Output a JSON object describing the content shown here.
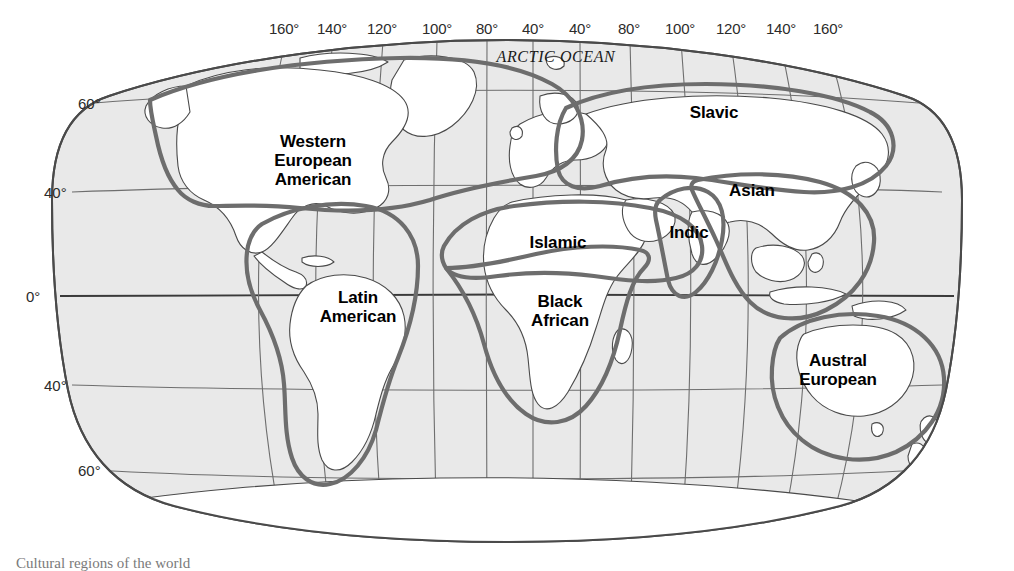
{
  "figure": {
    "title_caption": "Cultural regions of the world",
    "ocean_label": "ARCTIC OCEAN",
    "projection": "Robinson"
  },
  "colors": {
    "ocean_fill": "#e8e8e8",
    "land_fill": "#ffffff",
    "graticule": "#6e6e6e",
    "coastline": "#4a4a4a",
    "region_boundary": "#6e6e6e",
    "text": "#1a1a1a",
    "page_background": "#ffffff"
  },
  "axes": {
    "longitude_label_suffix": "°",
    "longitude_ticks": [
      {
        "label": "160°",
        "x": 284
      },
      {
        "label": "140°",
        "x": 332
      },
      {
        "label": "120°",
        "x": 382
      },
      {
        "label": "100°",
        "x": 437
      },
      {
        "label": "80°",
        "x": 487
      },
      {
        "label": "40°",
        "x": 533
      },
      {
        "label": "40°",
        "x": 580
      },
      {
        "label": "80°",
        "x": 629
      },
      {
        "label": "100°",
        "x": 680
      },
      {
        "label": "120°",
        "x": 731
      },
      {
        "label": "140°",
        "x": 781
      },
      {
        "label": "160°",
        "x": 828
      }
    ],
    "latitude_ticks": [
      {
        "label": "60°",
        "y": 103
      },
      {
        "label": "40°",
        "y": 192
      },
      {
        "label": "0°",
        "y": 296
      },
      {
        "label": "40°",
        "y": 385
      },
      {
        "label": "60°",
        "y": 470
      }
    ],
    "latitude_tick_x": [
      113,
      98,
      83,
      98,
      113
    ]
  },
  "regions": [
    {
      "id": "western-european-american",
      "label": "Western\nEuropean\nAmerican",
      "x": 313,
      "y": 160
    },
    {
      "id": "latin-american",
      "label": "Latin\nAmerican",
      "x": 358,
      "y": 307
    },
    {
      "id": "islamic",
      "label": "Islamic",
      "x": 558,
      "y": 242
    },
    {
      "id": "black-african",
      "label": "Black\nAfrican",
      "x": 560,
      "y": 311
    },
    {
      "id": "slavic",
      "label": "Slavic",
      "x": 714,
      "y": 112
    },
    {
      "id": "asian",
      "label": "Asian",
      "x": 752,
      "y": 190
    },
    {
      "id": "indic",
      "label": "Indic",
      "x": 689,
      "y": 232
    },
    {
      "id": "austral-european",
      "label": "Austral\nEuropean",
      "x": 838,
      "y": 370
    }
  ]
}
